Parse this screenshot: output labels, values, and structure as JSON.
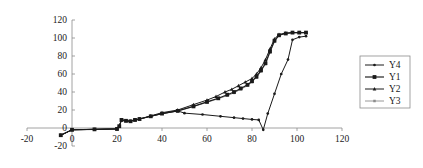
{
  "chart_data": {
    "type": "line",
    "title": "",
    "xlabel": "",
    "ylabel": "",
    "xlim": [
      -20,
      120
    ],
    "ylim": [
      -20,
      120
    ],
    "xticks": [
      -20,
      0,
      20,
      40,
      60,
      80,
      100,
      120
    ],
    "yticks": [
      -20,
      0,
      20,
      40,
      60,
      80,
      100,
      120
    ],
    "xtick_labels": [
      "-20",
      "0",
      "20",
      "40",
      "60",
      "80",
      "100",
      "120"
    ],
    "ytick_labels": [
      "-20",
      "0",
      "20",
      "40",
      "60",
      "80",
      "100",
      "120"
    ],
    "grid": false,
    "legend_position": "right outside",
    "series": [
      {
        "name": "Y4",
        "color": "#1a1a1a",
        "marker": "small-filled-circle",
        "x": [
          -5,
          0,
          10,
          20,
          21,
          22,
          24,
          26,
          28,
          30,
          35,
          40,
          47,
          50,
          58,
          66,
          72,
          76,
          80,
          83,
          85,
          87,
          90,
          93,
          96,
          98,
          101,
          104
        ],
        "y": [
          -8,
          -2,
          -1.5,
          -1,
          2,
          9,
          8,
          7.5,
          9,
          10,
          13,
          16,
          19,
          16.5,
          15,
          13,
          11.5,
          10.5,
          9.5,
          9,
          -2,
          16,
          38,
          60,
          76,
          98,
          101,
          102
        ]
      },
      {
        "name": "Y1",
        "color": "#1a1a1a",
        "marker": "large-filled-square",
        "x": [
          -5,
          0,
          10,
          20,
          21,
          22,
          24,
          26,
          28,
          30,
          35,
          40,
          47,
          54,
          60,
          65,
          69,
          72,
          75,
          78,
          80,
          82,
          84,
          86,
          88,
          90,
          92,
          95,
          98,
          101,
          104
        ],
        "y": [
          -8,
          -2,
          -1.5,
          -1,
          2,
          9,
          8,
          7.5,
          9,
          10,
          13,
          16,
          19,
          24,
          29,
          33,
          37,
          40,
          44,
          48,
          52,
          57,
          64,
          72,
          85,
          97,
          103,
          105,
          106,
          106,
          106
        ]
      },
      {
        "name": "Y2",
        "color": "#1a1a1a",
        "marker": "small-filled-triangle",
        "x": [
          -5,
          0,
          10,
          20,
          21,
          22,
          24,
          26,
          28,
          30,
          35,
          40,
          47,
          54,
          60,
          64,
          68,
          71,
          74,
          77,
          80,
          82,
          84,
          86,
          88,
          90,
          92,
          95,
          98,
          101,
          104
        ],
        "y": [
          -8,
          -2,
          -1.5,
          -1,
          2,
          9,
          8,
          7.5,
          9,
          10,
          13.5,
          17,
          20,
          26,
          31,
          35,
          40,
          43,
          47,
          51,
          55,
          60,
          67,
          76,
          88,
          99,
          104,
          105.5,
          106,
          106,
          106
        ]
      },
      {
        "name": "Y3",
        "color": "#8c8c8c",
        "marker": "small-gray-square",
        "x": [
          -5,
          0,
          10,
          20,
          21,
          22,
          24,
          26,
          28,
          30,
          35,
          40,
          47,
          54,
          60,
          65,
          69,
          72,
          75,
          78,
          80,
          82,
          84,
          86,
          88,
          90,
          92,
          95,
          98,
          101,
          104
        ],
        "y": [
          -8,
          -2,
          -1.5,
          -1,
          2,
          9,
          8,
          7.5,
          9,
          10,
          13,
          16,
          19,
          24,
          28.5,
          32.5,
          36,
          39,
          43,
          47,
          51,
          56,
          63,
          71,
          84,
          96,
          103,
          105,
          106,
          106,
          106
        ]
      }
    ],
    "legend_entries": [
      {
        "label": "Y4",
        "color": "#1a1a1a",
        "marker": "small-filled-circle"
      },
      {
        "label": "Y1",
        "color": "#1a1a1a",
        "marker": "large-filled-square"
      },
      {
        "label": "Y2",
        "color": "#1a1a1a",
        "marker": "small-filled-triangle"
      },
      {
        "label": "Y3",
        "color": "#8c8c8c",
        "marker": "small-gray-square"
      }
    ]
  }
}
